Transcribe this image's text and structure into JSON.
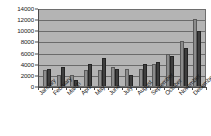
{
  "chart_data": {
    "type": "bar",
    "title": "",
    "xlabel": "",
    "ylabel": "",
    "ylim": [
      0,
      14000
    ],
    "yticks": [
      0,
      2000,
      4000,
      6000,
      8000,
      10000,
      12000,
      14000
    ],
    "ytick_labels": [
      "0",
      "2000",
      "4000",
      "6000",
      "8000",
      "10000",
      "12000",
      "14000"
    ],
    "grid": true,
    "legend": "none",
    "categories": [
      "January",
      "February",
      "March",
      "April",
      "May",
      "June",
      "July",
      "August",
      "September",
      "October",
      "November",
      "December"
    ],
    "series": [
      {
        "name": "Series 1",
        "color": "#8c8c8c",
        "values": [
          2900,
          2000,
          1900,
          2900,
          2900,
          3400,
          3000,
          3000,
          3900,
          5700,
          8000,
          11950
        ]
      },
      {
        "name": "Series 2",
        "color": "#3e3e3e",
        "values": [
          3000,
          3500,
          1100,
          4000,
          5000,
          3000,
          2000,
          4000,
          4400,
          5400,
          6900,
          9900
        ]
      }
    ]
  },
  "style": {
    "plot_background": "#b4b4b4",
    "gridline_color": "#6b6b6b",
    "axis_color": "#4a4a4a",
    "page_background": "#ffffff"
  }
}
